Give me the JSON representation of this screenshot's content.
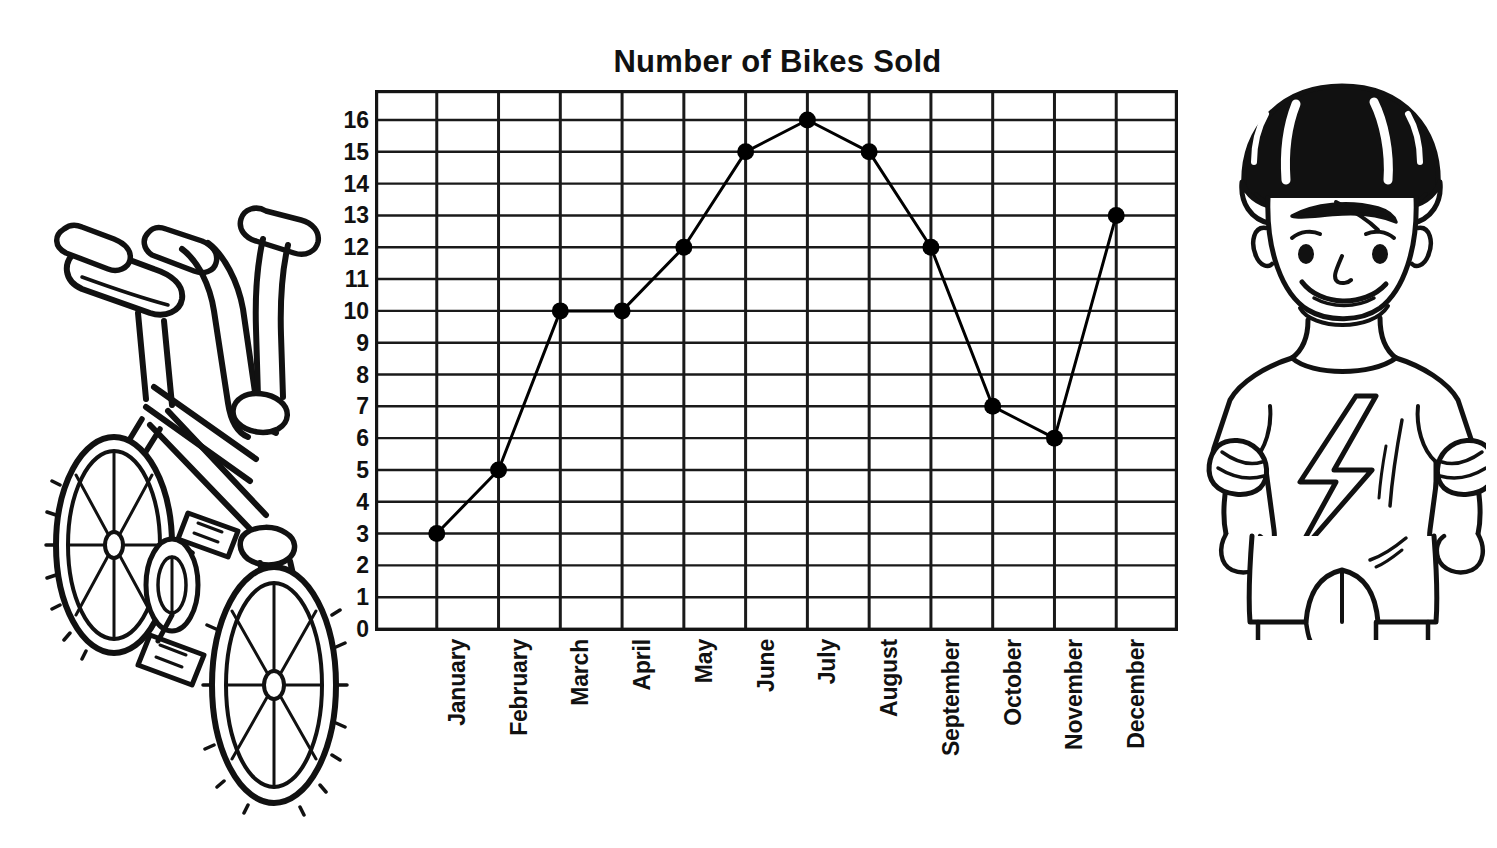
{
  "chart_data": {
    "type": "line",
    "title": "Number of Bikes Sold",
    "xlabel": "",
    "ylabel": "",
    "categories": [
      "January",
      "February",
      "March",
      "April",
      "May",
      "June",
      "July",
      "August",
      "September",
      "October",
      "November",
      "December"
    ],
    "values": [
      3,
      5,
      10,
      10,
      12,
      15,
      16,
      15,
      12,
      7,
      6,
      13
    ],
    "ylim": [
      0,
      16
    ],
    "y_ticks": [
      0,
      1,
      2,
      3,
      4,
      5,
      6,
      7,
      8,
      9,
      10,
      11,
      12,
      13,
      14,
      15,
      16
    ],
    "y_tick_labels": [
      "0",
      "1",
      "2",
      "3",
      "4",
      "5",
      "6",
      "7",
      "8",
      "9",
      "10",
      "11",
      "12",
      "13",
      "14",
      "15",
      "16"
    ],
    "grid": true,
    "legend": "none",
    "marker": "filled-circle",
    "line_color": "#000000",
    "marker_color": "#000000",
    "grid_color": "#1a1a1a",
    "background": "#ffffff"
  },
  "illustrations": {
    "bike": {
      "name": "bicycle-line-art",
      "description": "Black and white line drawing of a BMX bicycle with knobby tires"
    },
    "boy": {
      "name": "boy-with-helmet-line-art",
      "description": "Black and white line drawing of a smiling boy wearing a bike helmet, lightning bolt shirt, elbow pads and shorts"
    }
  }
}
